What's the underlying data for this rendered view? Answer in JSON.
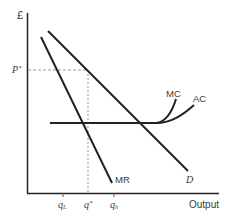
{
  "diagram": {
    "type": "economics-monopoly-cost-revenue",
    "axes": {
      "y_label": "£",
      "x_label": "Output"
    },
    "curves": [
      {
        "id": "D",
        "label": "D"
      },
      {
        "id": "MR",
        "label": "MR"
      },
      {
        "id": "MC",
        "label": "MC"
      },
      {
        "id": "AC",
        "label": "AC"
      }
    ],
    "price_label": "P*",
    "quantity_labels": {
      "q_low": "qL",
      "q_star": "q*",
      "q_high": "qh"
    },
    "colors": {
      "line": "#222222",
      "dashed": "#999999",
      "text": "#3a3a3a"
    }
  },
  "text": {
    "y_axis": "£",
    "x_axis": "Output",
    "p_star_main": "P",
    "p_star_sup": "*",
    "q_star_main": "q",
    "q_star_sup": "*",
    "q_low_main": "q",
    "q_low_sub": "L",
    "q_high_main": "q",
    "q_high_sub": "h",
    "mc": "MC",
    "ac": "AC",
    "mr": "MR",
    "d": "D"
  }
}
